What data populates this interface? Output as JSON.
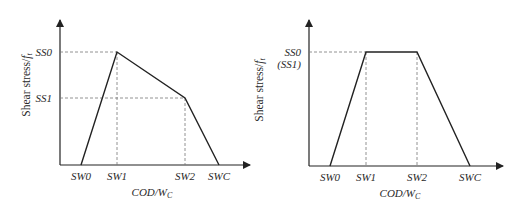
{
  "panels": [
    {
      "name": "left",
      "y_label": "Shear stress/",
      "y_label_sub": "f",
      "y_label_subscript": "t",
      "x_label": "COD/W",
      "x_label_sub": "C",
      "y_ticks": [
        {
          "label": "SS0",
          "y": 52
        },
        {
          "label": "SS1",
          "y": 98
        }
      ],
      "x_ticks": [
        {
          "label": "SW0",
          "x": 81
        },
        {
          "label": "SW1",
          "x": 117
        },
        {
          "label": "SW2",
          "x": 185
        },
        {
          "label": "SWC",
          "x": 219
        }
      ]
    },
    {
      "name": "right",
      "y_label": "Shear stress/",
      "y_label_sub": "f",
      "y_label_subscript": "t",
      "x_label": "COD/W",
      "x_label_sub": "C",
      "y_ticks": [
        {
          "label": "SS0",
          "y": 52
        },
        {
          "label": "(SS1)",
          "y": 64
        }
      ],
      "x_ticks": [
        {
          "label": "SW0",
          "x": 330
        },
        {
          "label": "SW1",
          "x": 366
        },
        {
          "label": "SW2",
          "x": 417
        },
        {
          "label": "SWC",
          "x": 470
        }
      ]
    }
  ],
  "colors": {
    "line": "#222222",
    "dash": "#777777",
    "text": "#2a2a2a"
  }
}
